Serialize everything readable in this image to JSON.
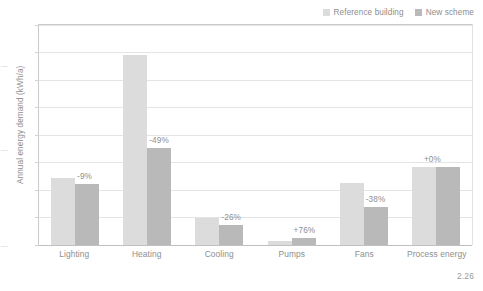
{
  "figure": {
    "number": "2.26"
  },
  "legend": {
    "position": "top-right",
    "items": [
      {
        "label": "Reference building",
        "color": "#dcdcdc"
      },
      {
        "label": "New scheme",
        "color": "#b9b9b9"
      }
    ]
  },
  "axes": {
    "ylabel": "Annual energy demand (kWh/a)",
    "xlabel": "",
    "gridlines": 8
  },
  "chart_data": {
    "type": "bar",
    "title": "",
    "xlabel": "",
    "ylabel": "Annual energy demand (kWh/a)",
    "ylim": [
      0,
      8
    ],
    "grid": true,
    "legend_position": "top-right",
    "categories": [
      "Lighting",
      "Heating",
      "Cooling",
      "Pumps",
      "Fans",
      "Process energy"
    ],
    "series": [
      {
        "name": "Reference building",
        "color": "#dcdcdc",
        "values": [
          2.45,
          6.9,
          1.0,
          0.15,
          2.25,
          2.85
        ]
      },
      {
        "name": "New scheme",
        "color": "#b9b9b9",
        "values": [
          2.23,
          3.52,
          0.74,
          0.26,
          1.4,
          2.85
        ]
      }
    ],
    "annotations": [
      "-9%",
      "-49%",
      "-26%",
      "+76%",
      "-38%",
      "+0%"
    ]
  }
}
